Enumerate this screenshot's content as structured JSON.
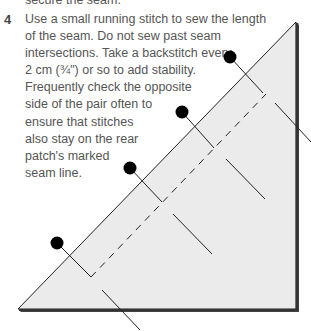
{
  "previous_text_fragment": "secure the seam.",
  "step": {
    "number": "4",
    "lines": [
      "Use a small running stitch to sew the length",
      "of the seam. Do not sew past seam",
      "intersections. Take a backstitch every",
      "2 cm (¾\") or so to add stability.",
      "Frequently check the opposite",
      "side of the pair often to",
      "ensure that stitches",
      "also stay on the rear",
      "patch's marked",
      "seam line."
    ]
  },
  "diagram": {
    "fill_color": "#ebebeb",
    "line_color": "#222222",
    "pins": 4
  }
}
